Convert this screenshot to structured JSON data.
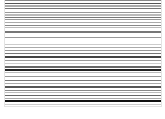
{
  "figure": {
    "stripes": [
      {
        "y": 0,
        "h": 1,
        "color": "#888888"
      },
      {
        "y": 3,
        "h": 1,
        "color": "#555555"
      },
      {
        "y": 5,
        "h": 2,
        "color": "#aaaaaa"
      },
      {
        "y": 8,
        "h": 1,
        "color": "#777777"
      },
      {
        "y": 12,
        "h": 1,
        "color": "#999999"
      },
      {
        "y": 14,
        "h": 2,
        "color": "#bbbbbb"
      },
      {
        "y": 17,
        "h": 1,
        "color": "#777777"
      },
      {
        "y": 19,
        "h": 1,
        "color": "#999999"
      },
      {
        "y": 22,
        "h": 1,
        "color": "#aaaaaa"
      },
      {
        "y": 25,
        "h": 1,
        "color": "#888888"
      },
      {
        "y": 27,
        "h": 1,
        "color": "#bbbbbb"
      },
      {
        "y": 31,
        "h": 2,
        "color": "#777777"
      },
      {
        "y": 37,
        "h": 1,
        "color": "#999999"
      },
      {
        "y": 44,
        "h": 1,
        "color": "#cccccc"
      },
      {
        "y": 47,
        "h": 1,
        "color": "#aaaaaa"
      },
      {
        "y": 50,
        "h": 1,
        "color": "#999999"
      },
      {
        "y": 53,
        "h": 1,
        "color": "#777777"
      },
      {
        "y": 56,
        "h": 2,
        "color": "#444444"
      },
      {
        "y": 60,
        "h": 1,
        "color": "#999999"
      },
      {
        "y": 63,
        "h": 1,
        "color": "#cccccc"
      },
      {
        "y": 66,
        "h": 2,
        "color": "#666666"
      },
      {
        "y": 69,
        "h": 2,
        "color": "#222222"
      },
      {
        "y": 72,
        "h": 1,
        "color": "#bbbbbb"
      },
      {
        "y": 76,
        "h": 1,
        "color": "#999999"
      },
      {
        "y": 80,
        "h": 1,
        "color": "#777777"
      },
      {
        "y": 83,
        "h": 1,
        "color": "#aaaaaa"
      },
      {
        "y": 86,
        "h": 2,
        "color": "#555555"
      },
      {
        "y": 90,
        "h": 1,
        "color": "#888888"
      },
      {
        "y": 92,
        "h": 1,
        "color": "#bbbbbb"
      },
      {
        "y": 95,
        "h": 1,
        "color": "#666666"
      },
      {
        "y": 98,
        "h": 1,
        "color": "#aaaaaa"
      },
      {
        "y": 100,
        "h": 2,
        "color": "#111111"
      },
      {
        "y": 104,
        "h": 1,
        "color": "#cccccc"
      }
    ]
  }
}
